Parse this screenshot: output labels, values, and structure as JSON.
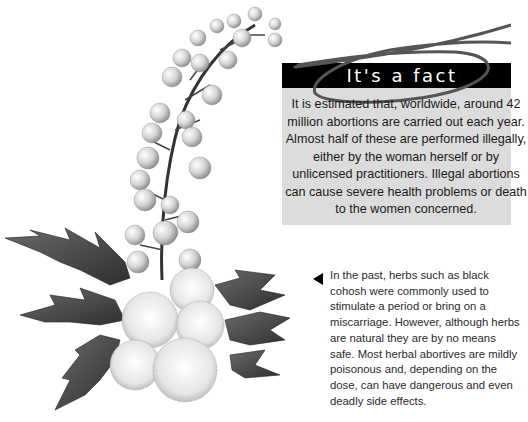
{
  "fact_box": {
    "title": "It's a fact",
    "body": "It is estimated that, worldwide, around 42 million abortions are carried out each year. Almost half of these are performed illegally, either by the woman herself or by unlicensed practitioners. Illegal abortions can cause severe health problems or death to the women concerned.",
    "colors": {
      "title_bar": "#000000",
      "title_text": "#ffffff",
      "box_bg": "#dcdcdc",
      "loop": "#555555"
    }
  },
  "caption": {
    "pointer_icon": "left-triangle-pointer",
    "text": "In the past, herbs such as black cohosh were commonly used to stimulate a period or bring on a miscarriage. However, although herbs are natural they are by no means safe. Most herbal abortives are mildly poisonous and, depending on the dose, can have dangerous and even deadly side effects."
  },
  "illustration": {
    "subject": "black cohosh plant",
    "style": "grayscale botanical drawing"
  }
}
